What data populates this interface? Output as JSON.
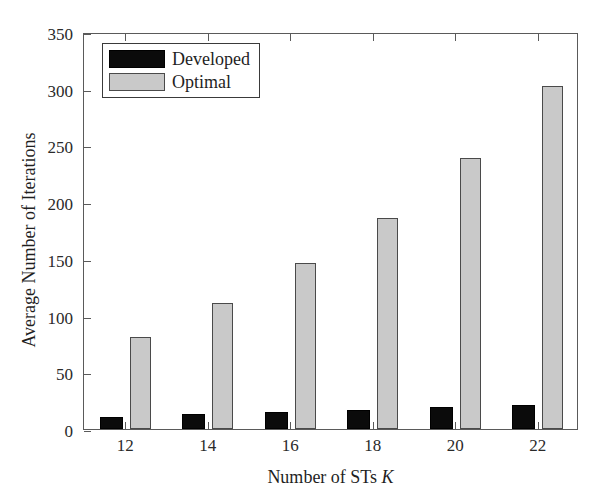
{
  "chart_data": {
    "type": "bar",
    "title": "",
    "xlabel": "Number of STs K",
    "xlabel_plain": "Number of STs ",
    "xlabel_italic": "K",
    "ylabel": "Average Number of Iterations",
    "categories": [
      "12",
      "14",
      "16",
      "18",
      "20",
      "22"
    ],
    "series": [
      {
        "name": "Developed",
        "color": "#0b0b0b",
        "values": [
          11,
          13,
          15,
          17,
          19,
          21
        ]
      },
      {
        "name": "Optimal",
        "color": "#c9c9c9",
        "values": [
          81,
          111,
          146,
          186,
          239,
          302
        ]
      }
    ],
    "ylim": [
      0,
      350
    ],
    "yticks": [
      0,
      50,
      100,
      150,
      200,
      250,
      300,
      350
    ],
    "ytick_labels": [
      "0",
      "50",
      "100",
      "150",
      "200",
      "250",
      "300",
      "350"
    ],
    "grid": false,
    "legend_position": "top-left",
    "legend_entries": [
      "Developed",
      "Optimal"
    ]
  },
  "legend": {
    "items": [
      {
        "label": "Developed"
      },
      {
        "label": "Optimal"
      }
    ]
  }
}
